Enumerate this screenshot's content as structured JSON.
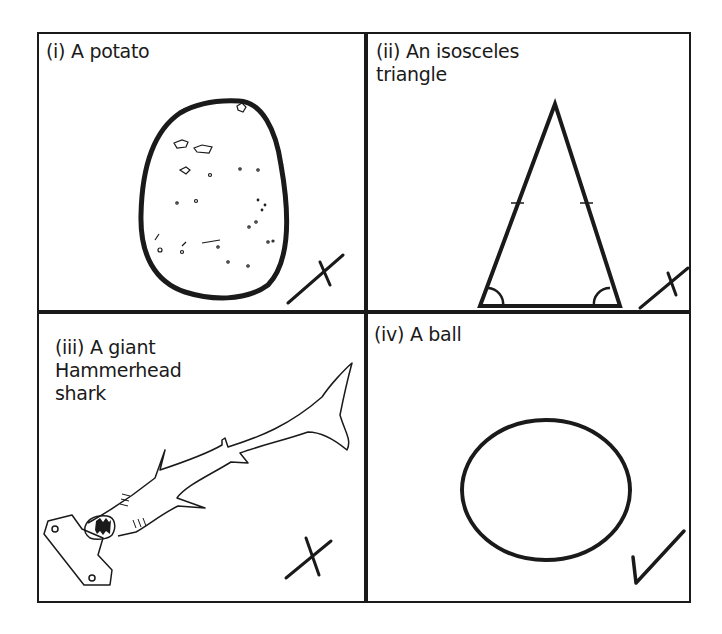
{
  "panels": [
    {
      "id": "i",
      "label": "(i) A potato",
      "verdict": "incorrect",
      "mark": "cross-icon"
    },
    {
      "id": "ii",
      "label": "(ii) An isosceles\ntriangle",
      "verdict": "incorrect",
      "mark": "cross-icon"
    },
    {
      "id": "iii",
      "label": "(iii) A giant\nHammerhead\nshark",
      "verdict": "incorrect",
      "mark": "cross-icon"
    },
    {
      "id": "iv",
      "label": "(iv) A ball",
      "verdict": "correct",
      "mark": "tick-icon"
    }
  ],
  "colors": {
    "ink": "#1a1a1a",
    "paper": "#ffffff"
  }
}
